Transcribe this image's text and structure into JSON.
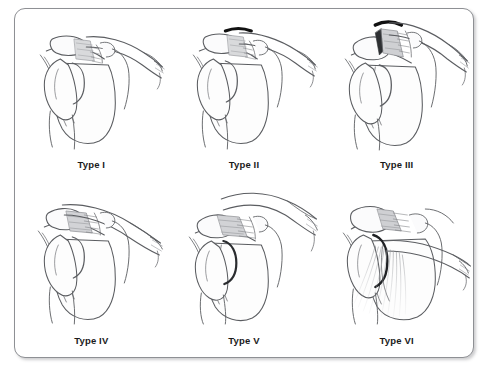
{
  "figure": {
    "title_visible": false,
    "frame": {
      "border_color": "#8e9094",
      "background_color": "#ffffff",
      "corner_radius_px": 11,
      "shadow": true
    },
    "layout": {
      "columns": 3,
      "rows": 2
    },
    "line_art": {
      "stroke_color": "#5b5d61",
      "dark_accent_color": "#111111",
      "shade_fill": "#d7d8da",
      "light_fill": "#fbfbfc"
    },
    "panels": [
      {
        "id": "type-1",
        "label": "Type I",
        "row": 1,
        "column": 1,
        "has_dark_marker": false,
        "has_muscle_striations": false,
        "clavicle_displacement": "none"
      },
      {
        "id": "type-2",
        "label": "Type II",
        "row": 1,
        "column": 2,
        "has_dark_marker": true,
        "has_muscle_striations": false,
        "clavicle_displacement": "slight-superior"
      },
      {
        "id": "type-3",
        "label": "Type III",
        "row": 1,
        "column": 3,
        "has_dark_marker": true,
        "has_muscle_striations": false,
        "clavicle_displacement": "superior"
      },
      {
        "id": "type-4",
        "label": "Type IV",
        "row": 2,
        "column": 1,
        "has_dark_marker": false,
        "has_muscle_striations": false,
        "clavicle_displacement": "posterior"
      },
      {
        "id": "type-5",
        "label": "Type V",
        "row": 2,
        "column": 2,
        "has_dark_marker": false,
        "has_muscle_striations": false,
        "clavicle_displacement": "marked-superior"
      },
      {
        "id": "type-6",
        "label": "Type VI",
        "row": 2,
        "column": 3,
        "has_dark_marker": false,
        "has_muscle_striations": true,
        "clavicle_displacement": "inferior"
      }
    ]
  }
}
